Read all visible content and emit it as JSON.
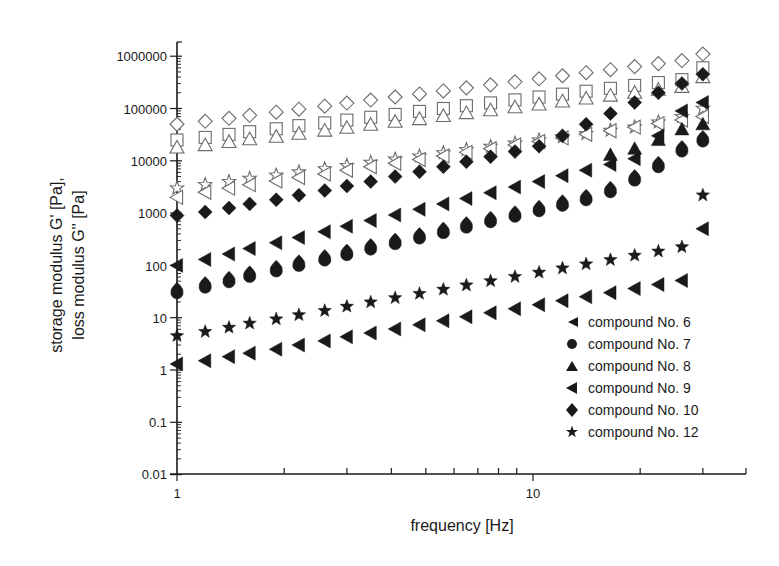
{
  "chart_data": {
    "type": "scatter",
    "title": "",
    "xlabel": "frequency [Hz]",
    "ylabel_line1": "storage modulus G' [Pa],",
    "ylabel_line2": "loss modulus G'' [Pa]",
    "xscale": "log",
    "yscale": "log",
    "xlim": [
      1,
      40
    ],
    "ylim": [
      0.01,
      2000000
    ],
    "grid": false,
    "legend_position": "lower right",
    "x_ticks": [
      1,
      10
    ],
    "x_tick_labels": [
      "1",
      "10"
    ],
    "y_ticks": [
      0.01,
      0.1,
      1,
      10,
      100,
      1000,
      10000,
      100000,
      1000000
    ],
    "y_tick_labels": [
      "0.01",
      "0.1",
      "1",
      "10",
      "100",
      "1000",
      "10000",
      "100000",
      "1000000"
    ],
    "legend": [
      {
        "label": "compound No. 6",
        "marker": "triangle-left"
      },
      {
        "label": "compound No. 7",
        "marker": "circle"
      },
      {
        "label": "compound No. 8",
        "marker": "triangle-up"
      },
      {
        "label": "compound No. 9",
        "marker": "triangle-left"
      },
      {
        "label": "compound No. 10",
        "marker": "diamond"
      },
      {
        "label": "compound No. 12",
        "marker": "star"
      }
    ],
    "x": [
      1.0,
      1.2,
      1.4,
      1.6,
      1.9,
      2.2,
      2.6,
      3.0,
      3.5,
      4.1,
      4.8,
      5.6,
      6.5,
      7.6,
      8.9,
      10.4,
      12.1,
      14.1,
      16.5,
      19.3,
      22.5,
      26.2,
      30.0
    ],
    "series": [
      {
        "name": "compound No. 10 G'",
        "marker": "diamond-open",
        "values": [
          50000,
          57000,
          65000,
          74000,
          85000,
          97000,
          111000,
          127000,
          145000,
          166000,
          190000,
          217000,
          248000,
          283000,
          324000,
          370000,
          423000,
          484000,
          553000,
          632000,
          722000,
          825000,
          1100000
        ]
      },
      {
        "name": "compound No. 8 G' (open square)",
        "marker": "square-open",
        "values": [
          25000,
          28000,
          32000,
          36000,
          41000,
          47000,
          53000,
          60000,
          68000,
          77000,
          88000,
          100000,
          113000,
          128000,
          146000,
          166000,
          188000,
          214000,
          243000,
          276000,
          313000,
          356000,
          600000
        ]
      },
      {
        "name": "compound No. 8 G'' (open triangle)",
        "marker": "triangle-up-open",
        "values": [
          18000,
          20000,
          23000,
          26000,
          29000,
          33000,
          38000,
          43000,
          49000,
          56000,
          63000,
          72000,
          82000,
          93000,
          106000,
          120000,
          137000,
          156000,
          177000,
          201000,
          229000,
          260000,
          400000
        ]
      },
      {
        "name": "compound No. 12 G' (open star)",
        "marker": "star-open",
        "values": [
          3000,
          3500,
          4000,
          4600,
          5300,
          6100,
          7000,
          8100,
          9300,
          10700,
          12300,
          14200,
          16300,
          18800,
          21600,
          24900,
          28600,
          33000,
          38000,
          44000,
          55000,
          70000,
          100000
        ]
      },
      {
        "name": "compound No. 6 G' (open triangle-left)",
        "marker": "triangle-left-open",
        "values": [
          2000,
          2500,
          3000,
          3500,
          4100,
          4800,
          5600,
          6600,
          7700,
          9000,
          10600,
          12400,
          14500,
          17000,
          20000,
          23400,
          27400,
          32100,
          37600,
          44000,
          51500,
          60300,
          70000
        ]
      },
      {
        "name": "compound No. 10",
        "marker": "diamond",
        "values": [
          900,
          1050,
          1250,
          1500,
          1800,
          2200,
          2700,
          3300,
          4000,
          5000,
          6200,
          7700,
          9600,
          12000,
          15000,
          19000,
          30000,
          50000,
          80000,
          130000,
          200000,
          300000,
          450000
        ]
      },
      {
        "name": "compound No. 9",
        "marker": "triangle-left",
        "values": [
          100,
          130,
          165,
          210,
          270,
          340,
          440,
          560,
          720,
          920,
          1180,
          1500,
          1900,
          2450,
          3150,
          4000,
          5200,
          6600,
          8500,
          11000,
          30000,
          90000,
          130000
        ]
      },
      {
        "name": "compound No. 8",
        "marker": "triangle-up",
        "values": [
          null,
          null,
          null,
          null,
          null,
          null,
          null,
          null,
          null,
          null,
          null,
          null,
          null,
          null,
          null,
          null,
          null,
          null,
          13000,
          17000,
          25000,
          40000,
          50000
        ]
      },
      {
        "name": "compound No. 7",
        "marker": "circle",
        "values": [
          35,
          45,
          57,
          72,
          92,
          117,
          148,
          188,
          240,
          305,
          390,
          495,
          630,
          800,
          1020,
          1300,
          1650,
          2100,
          3000,
          5000,
          9000,
          18000,
          28000
        ]
      },
      {
        "name": "compound No. 12",
        "marker": "star",
        "values": [
          4.5,
          5.4,
          6.5,
          7.8,
          9.4,
          11.3,
          13.6,
          16.4,
          19.8,
          23.9,
          28.8,
          34.7,
          41.8,
          50.4,
          60.8,
          73.3,
          88.4,
          106,
          128,
          155,
          186,
          225,
          2200
        ]
      },
      {
        "name": "compound No. 6",
        "marker": "triangle-left",
        "values": [
          1.3,
          1.5,
          1.8,
          2.1,
          2.5,
          3.0,
          3.6,
          4.3,
          5.1,
          6.1,
          7.3,
          8.7,
          10.4,
          12.4,
          14.8,
          17.7,
          21.1,
          25.2,
          30.1,
          36.0,
          43.0,
          51.3,
          500
        ]
      }
    ]
  },
  "axes": {
    "x_label": "frequency [Hz]",
    "y_label_line1": "storage modulus G' [Pa],",
    "y_label_line2": "loss modulus G'' [Pa]",
    "x_tick_labels": [
      "1",
      "10"
    ],
    "y_tick_labels": [
      "1000000",
      "100000",
      "10000",
      "1000",
      "100",
      "10",
      "1",
      "0.1",
      "0.01"
    ]
  },
  "legend": {
    "items": [
      {
        "label": "compound No. 6"
      },
      {
        "label": "compound No. 7"
      },
      {
        "label": "compound No. 8"
      },
      {
        "label": "compound No. 9"
      },
      {
        "label": "compound No. 10"
      },
      {
        "label": "compound No. 12"
      }
    ]
  },
  "colors": {
    "ink": "#1a1a1a",
    "open_marker": "#6b6b6b",
    "background": "#ffffff"
  }
}
